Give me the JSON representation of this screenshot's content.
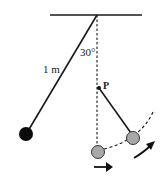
{
  "diagram": {
    "labels": {
      "angle": "30°",
      "length": "1 m",
      "peg": "P"
    },
    "colors": {
      "line": "#1a1a1a",
      "bob_left": "#0a0a0a",
      "bob_gray": "#a8a8a8"
    },
    "elements": {
      "ceiling": "horizontal support",
      "pivot_string": "string of length 1 m released at 30° from vertical",
      "vertical_reference": "dashed vertical line",
      "peg": "peg P on the vertical below pivot",
      "bob_start": "black bob at initial position",
      "bob_lowest": "gray bob at lowest point",
      "bob_swing": "gray bob swinging about peg P",
      "arc": "dashed arc path",
      "arrows": [
        "motion arrow at bottom",
        "motion arrow along arc"
      ]
    }
  }
}
